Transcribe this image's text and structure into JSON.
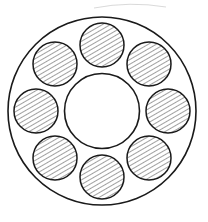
{
  "figure": {
    "kind": "engineering-section-drawing",
    "canvas": {
      "width": 208,
      "height": 222,
      "background": "#ffffff"
    },
    "colors": {
      "outline": "#1a1a1a",
      "hatch": "#2b2b2b",
      "fill": "#ffffff",
      "artifact": "#9a9a9a"
    },
    "line_weights": {
      "outer_outline": 1.6,
      "inner_outline": 1.6,
      "bore_outline": 1.5,
      "hatch": 0.9
    }
  },
  "chart_data": {
    "type": "scatter",
    "xlabel": "",
    "ylabel": "",
    "xlim": [
      0,
      208
    ],
    "ylim": [
      0,
      222
    ],
    "grid": false,
    "legend": "none",
    "geometry": {
      "center": {
        "x": 102,
        "y": 111
      },
      "outer_radius": 94,
      "inner_hole_radius": 37.5,
      "bore_radius": 22,
      "bore_pitch_radius": 66,
      "bore_count": 8,
      "bore_start_angle_deg": -90,
      "bore_angle_step_deg": 45,
      "hatch_angle_deg": 60,
      "hatch_spacing_px": 4
    },
    "bores": [
      {
        "index": 1,
        "angle_deg": -90,
        "cx": 102,
        "cy": 45,
        "r": 22,
        "hatched": true
      },
      {
        "index": 2,
        "angle_deg": -45,
        "cx": 149,
        "cy": 64,
        "r": 22,
        "hatched": true
      },
      {
        "index": 3,
        "angle_deg": 0,
        "cx": 168,
        "cy": 111,
        "r": 22,
        "hatched": true
      },
      {
        "index": 4,
        "angle_deg": 45,
        "cx": 149,
        "cy": 158,
        "r": 22,
        "hatched": true
      },
      {
        "index": 5,
        "angle_deg": 90,
        "cx": 102,
        "cy": 177,
        "r": 22,
        "hatched": true
      },
      {
        "index": 6,
        "angle_deg": 135,
        "cx": 55,
        "cy": 158,
        "r": 22,
        "hatched": true
      },
      {
        "index": 7,
        "angle_deg": 180,
        "cx": 36,
        "cy": 111,
        "r": 22,
        "hatched": true
      },
      {
        "index": 8,
        "angle_deg": 225,
        "cx": 55,
        "cy": 64,
        "r": 22,
        "hatched": true
      }
    ],
    "artifact_arc": {
      "description": "faint partial arc fragment near top edge",
      "start": {
        "x": 94,
        "y": 8
      },
      "control": {
        "x": 130,
        "y": 1
      },
      "end": {
        "x": 166,
        "y": 7
      }
    }
  }
}
